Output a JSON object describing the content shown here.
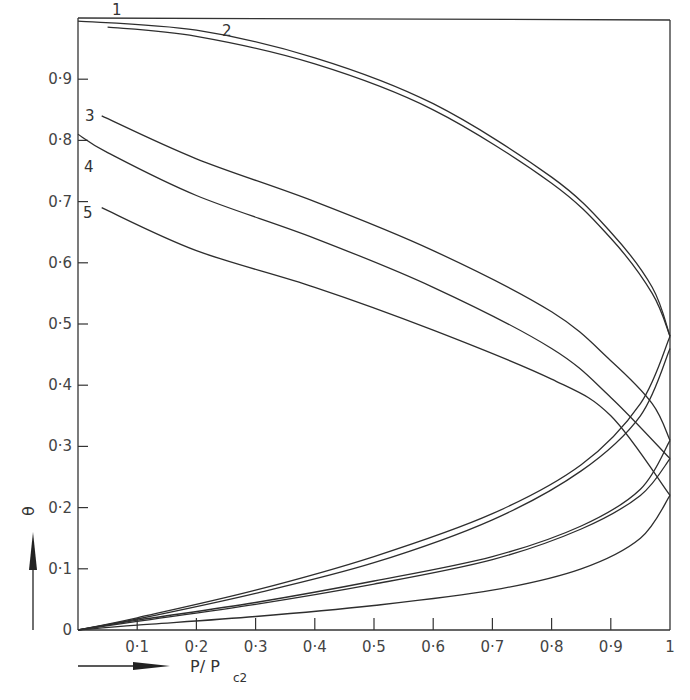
{
  "chart_data": {
    "type": "line",
    "title": "",
    "xlabel": "P/P_c2",
    "ylabel": "θ",
    "xlim": [
      0,
      1
    ],
    "ylim": [
      0,
      1.0
    ],
    "grid": false,
    "legend": "inline numeric labels 1–5 at left end of upper branches",
    "x_ticks": [
      "0.1",
      "0.2",
      "0.3",
      "0.4",
      "0.5",
      "0.6",
      "0.7",
      "0.8",
      "0.9",
      "1"
    ],
    "y_ticks": [
      "0",
      "0.1",
      "0.2",
      "0.3",
      "0.4",
      "0.5",
      "0.6",
      "0.7",
      "0.8",
      "0.9"
    ],
    "series": [
      {
        "name": "1",
        "upper_branch": {
          "x": [
            0.05,
            0.2,
            0.4,
            0.6,
            0.8,
            0.9,
            0.97,
            1.0
          ],
          "y": [
            0.985,
            0.97,
            0.925,
            0.85,
            0.73,
            0.64,
            0.55,
            0.48
          ]
        },
        "lower_branch": {
          "x": [
            0.0,
            0.1,
            0.3,
            0.5,
            0.7,
            0.85,
            0.95,
            1.0
          ],
          "y": [
            0.0,
            0.018,
            0.06,
            0.11,
            0.18,
            0.26,
            0.35,
            0.46
          ]
        }
      },
      {
        "name": "2",
        "upper_branch": {
          "x": [
            0.0,
            0.2,
            0.4,
            0.6,
            0.8,
            0.9,
            0.97,
            1.0
          ],
          "y": [
            0.995,
            0.98,
            0.935,
            0.86,
            0.74,
            0.65,
            0.56,
            0.48
          ]
        },
        "lower_branch": {
          "x": [
            0.0,
            0.1,
            0.3,
            0.5,
            0.7,
            0.85,
            0.95,
            1.0
          ],
          "y": [
            0.0,
            0.02,
            0.065,
            0.12,
            0.19,
            0.27,
            0.37,
            0.48
          ]
        }
      },
      {
        "name": "3",
        "upper_branch": {
          "x": [
            0.04,
            0.2,
            0.4,
            0.6,
            0.8,
            0.9,
            0.97,
            1.0
          ],
          "y": [
            0.84,
            0.77,
            0.7,
            0.62,
            0.52,
            0.44,
            0.37,
            0.31
          ]
        },
        "lower_branch": {
          "x": [
            0.0,
            0.1,
            0.3,
            0.5,
            0.7,
            0.85,
            0.95,
            1.0
          ],
          "y": [
            0.0,
            0.016,
            0.045,
            0.08,
            0.12,
            0.17,
            0.23,
            0.31
          ]
        }
      },
      {
        "name": "4",
        "upper_branch": {
          "x": [
            0.0,
            0.05,
            0.2,
            0.4,
            0.6,
            0.8,
            0.9,
            1.0
          ],
          "y": [
            0.81,
            0.78,
            0.71,
            0.64,
            0.56,
            0.46,
            0.38,
            0.28
          ]
        },
        "lower_branch": {
          "x": [
            0.0,
            0.1,
            0.3,
            0.5,
            0.7,
            0.85,
            0.95,
            1.0
          ],
          "y": [
            0.0,
            0.014,
            0.042,
            0.075,
            0.115,
            0.165,
            0.22,
            0.28
          ]
        }
      },
      {
        "name": "5",
        "upper_branch": {
          "x": [
            0.04,
            0.2,
            0.4,
            0.6,
            0.8,
            0.9,
            1.0
          ],
          "y": [
            0.69,
            0.62,
            0.56,
            0.49,
            0.41,
            0.35,
            0.22
          ]
        },
        "lower_branch": {
          "x": [
            0.0,
            0.1,
            0.3,
            0.5,
            0.7,
            0.85,
            0.95,
            1.0
          ],
          "y": [
            0.0,
            0.008,
            0.022,
            0.04,
            0.065,
            0.1,
            0.15,
            0.22
          ]
        }
      }
    ]
  },
  "labels": {
    "curve_1": "1",
    "curve_2": "2",
    "curve_3": "3",
    "curve_4": "4",
    "curve_5": "5",
    "y_axis_symbol": "θ",
    "x_axis_title_main": "P/ P",
    "x_axis_title_sub": "c2"
  }
}
